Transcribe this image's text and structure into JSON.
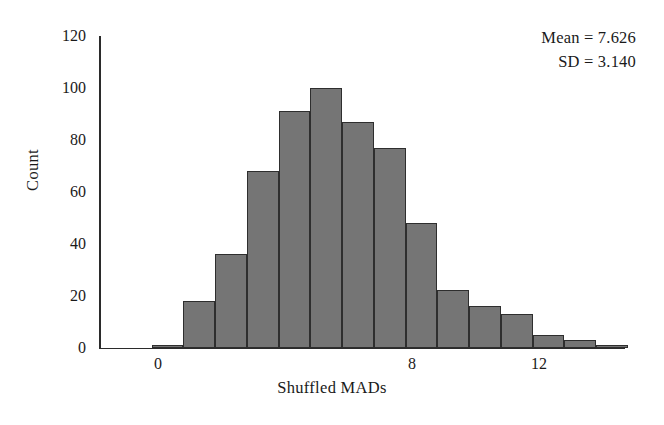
{
  "annotation": {
    "mean_label": "Mean = 7.626",
    "sd_label": "SD = 3.140"
  },
  "chart_data": {
    "type": "bar",
    "title": "",
    "xlabel": "Shuffled MADs",
    "ylabel": "Count",
    "grid": false,
    "legend": "none",
    "xlim": [
      -2,
      20.5
    ],
    "ylim": [
      0,
      120
    ],
    "ytick_labels": [
      "0",
      "20",
      "40",
      "60",
      "80",
      "100",
      "120"
    ],
    "ytick_values": [
      0,
      20,
      40,
      60,
      80,
      100,
      120
    ],
    "xtick_labels": [
      "0",
      "8",
      "12",
      "18"
    ],
    "xtick_values": [
      0,
      8,
      12,
      18
    ],
    "bin_width": 1,
    "bin_starts": [
      -0.2,
      0.8,
      1.8,
      2.8,
      3.8,
      4.8,
      5.8,
      6.8,
      7.8,
      8.8,
      9.8,
      10.8,
      11.8,
      12.8,
      13.8
    ],
    "categories": [
      "0",
      "1",
      "2",
      "3",
      "4",
      "5",
      "6",
      "7",
      "8",
      "9",
      "10",
      "11",
      "12",
      "13",
      "14"
    ],
    "values": [
      1,
      18,
      36,
      68,
      91,
      100,
      87,
      77,
      48,
      22,
      16,
      13,
      5,
      3,
      1
    ],
    "bar_color": "#757575",
    "bar_edge_color": "#2e2e2e",
    "axis_color": "#2b2b2b",
    "mean": 7.626,
    "sd": 3.14
  }
}
